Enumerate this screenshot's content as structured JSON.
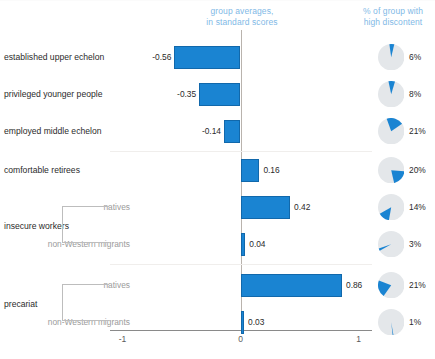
{
  "headers": {
    "averages": "group averages,\nin standard scores",
    "discontent": "% of group with\nhigh discontent"
  },
  "axis": {
    "ticks": [
      "-1",
      "0",
      "1"
    ],
    "min": -1,
    "max": 1
  },
  "groups": [
    {
      "label": "insecure workers"
    },
    {
      "label": "precariat"
    }
  ],
  "chart_data": {
    "type": "bar",
    "title": "",
    "subtitle": "",
    "xlabel": "group averages, in standard scores",
    "ylabel": "",
    "xlim": [
      -1,
      1
    ],
    "grid": false,
    "orientation": "horizontal",
    "categories": [
      "established upper echelon",
      "privileged younger people",
      "employed middle echelon",
      "comfortable retirees",
      "natives",
      "non-Western migrants",
      "natives",
      "non-Western migrants"
    ],
    "values": [
      -0.56,
      -0.35,
      -0.14,
      0.16,
      0.42,
      0.04,
      0.86,
      0.03
    ],
    "value_labels": [
      "-0.56",
      "-0.35",
      "-0.14",
      "0.16",
      "0.42",
      "0.04",
      "0.86",
      "0.03"
    ],
    "secondary_series": {
      "name": "% of group with high discontent",
      "type": "pie",
      "values": [
        6,
        8,
        21,
        20,
        14,
        3,
        21,
        1
      ],
      "labels": [
        "6%",
        "8%",
        "21%",
        "20%",
        "14%",
        "3%",
        "21%",
        "1%"
      ],
      "slice_color": "#1a84d2",
      "rest_color": "#e4e7ea",
      "start_angles_deg": [
        -8,
        -12,
        -20,
        95,
        190,
        240,
        215,
        170
      ]
    },
    "bar_color": "#1a84d2",
    "bar_border_color": "#1168ab"
  }
}
